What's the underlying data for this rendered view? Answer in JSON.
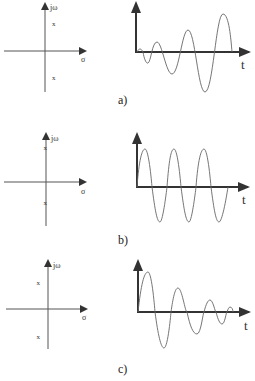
{
  "figure": {
    "panels": [
      {
        "id": "a",
        "caption": "a)",
        "pole_plot": {
          "y_axis_label": "jω",
          "x_axis_label": "σ",
          "poles": [
            {
              "marker": "x",
              "position": "right half-plane, upper"
            },
            {
              "marker": "x",
              "position": "right half-plane, lower"
            }
          ]
        },
        "response": {
          "x_axis_label": "t",
          "behavior": "growing oscillation"
        }
      },
      {
        "id": "b",
        "caption": "b)",
        "pole_plot": {
          "y_axis_label": "jω",
          "x_axis_label": "σ",
          "poles": [
            {
              "marker": "x",
              "position": "imaginary axis, upper"
            },
            {
              "marker": "x",
              "position": "imaginary axis, lower"
            }
          ]
        },
        "response": {
          "x_axis_label": "t",
          "behavior": "sustained oscillation"
        }
      },
      {
        "id": "c",
        "caption": "c)",
        "pole_plot": {
          "y_axis_label": "jω",
          "x_axis_label": "σ",
          "poles": [
            {
              "marker": "x",
              "position": "left half-plane, upper"
            },
            {
              "marker": "x",
              "position": "left half-plane, lower"
            }
          ]
        },
        "response": {
          "x_axis_label": "t",
          "behavior": "decaying oscillation"
        }
      }
    ],
    "colors": {
      "axis": "#333333",
      "curve": "#555555"
    }
  }
}
